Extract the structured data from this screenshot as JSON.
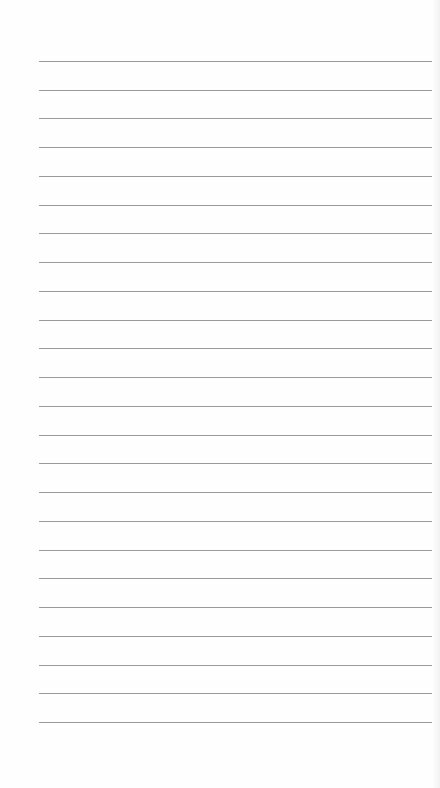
{
  "page": {
    "type": "lined-paper",
    "background_color": "#fefefe",
    "line_color": "#9a9a9a",
    "line_count": 24,
    "first_line_y": 61,
    "line_spacing": 28.74,
    "line_left_x": 39,
    "line_right_x": 432,
    "lines_text": [
      "",
      "",
      "",
      "",
      "",
      "",
      "",
      "",
      "",
      "",
      "",
      "",
      "",
      "",
      "",
      "",
      "",
      "",
      "",
      "",
      "",
      "",
      "",
      ""
    ]
  }
}
